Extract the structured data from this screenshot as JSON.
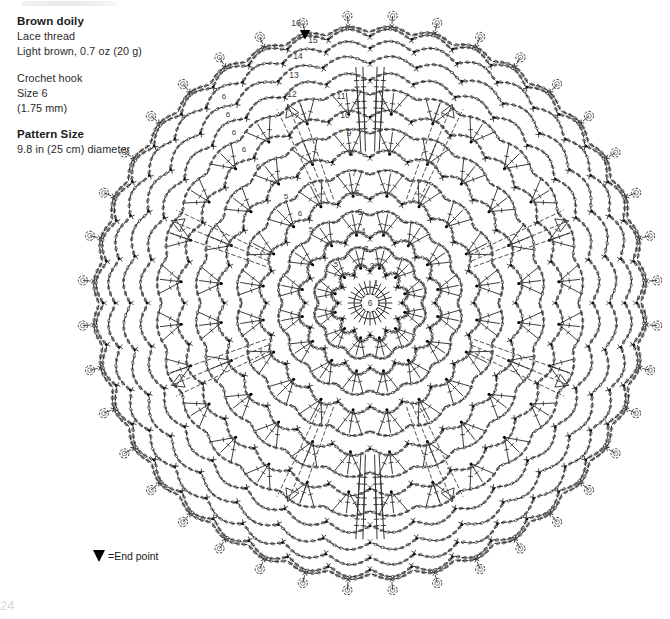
{
  "document": {
    "page_number": "24",
    "artifact_note": ""
  },
  "info": {
    "title": "Brown doily",
    "material_line1": "Lace thread",
    "material_line2": "Light brown, 0.7 oz (20 g)",
    "hook_line1": "Crochet hook",
    "hook_line2": "Size 6",
    "hook_line3": "(1.75 mm)",
    "size_heading": "Pattern Size",
    "size_value": "9.8 in (25 cm) diameter"
  },
  "legend": {
    "symbol": "end-point-triangle",
    "label": "=End point"
  },
  "chart_data": {
    "type": "diagram",
    "grid": false,
    "legend_position": "bottom-left",
    "center": {
      "x": 370,
      "y": 303
    },
    "outer_radius": 288,
    "symmetry_sectors": 8,
    "ink_color": "#333333",
    "accent_color": "#000000",
    "label_color": "#3a3a3a",
    "center_ring": {
      "label": "6",
      "radius": 9
    },
    "end_point": {
      "x": 305,
      "y": 30,
      "round": 16
    },
    "round_labels": [
      {
        "round": 1,
        "text": "1",
        "x": 376,
        "y": 286
      },
      {
        "round": 2,
        "text": "2",
        "x": 372,
        "y": 269
      },
      {
        "round": 3,
        "text": "3",
        "x": 366,
        "y": 252
      },
      {
        "round": 4,
        "text": "4",
        "x": 363,
        "y": 234
      },
      {
        "round": 5,
        "text": "5",
        "x": 360,
        "y": 215
      },
      {
        "round": 6,
        "text": "6",
        "x": 357,
        "y": 196
      },
      {
        "round": 7,
        "text": "7",
        "x": 354,
        "y": 176
      },
      {
        "round": 8,
        "text": "8",
        "x": 351,
        "y": 156
      },
      {
        "round": 9,
        "text": "9",
        "x": 349,
        "y": 136
      },
      {
        "round": 10,
        "text": "10",
        "x": 345,
        "y": 118
      },
      {
        "round": 11,
        "text": "11",
        "x": 341,
        "y": 99
      },
      {
        "round": 12,
        "text": "12",
        "x": 292,
        "y": 97
      },
      {
        "round": 13,
        "text": "13",
        "x": 294,
        "y": 78
      },
      {
        "round": 14,
        "text": "14",
        "x": 298,
        "y": 59
      },
      {
        "round": 15,
        "text": "15",
        "x": 313,
        "y": 43
      },
      {
        "round": 16,
        "text": "16",
        "x": 296,
        "y": 26
      }
    ],
    "inner_round_labels": [
      {
        "text": "6",
        "x": 341,
        "y": 289
      },
      {
        "text": "5",
        "x": 336,
        "y": 267
      },
      {
        "text": "4",
        "x": 327,
        "y": 247
      },
      {
        "text": "5",
        "x": 311,
        "y": 232
      },
      {
        "text": "6",
        "x": 300,
        "y": 216
      },
      {
        "text": "5",
        "x": 286,
        "y": 199
      },
      {
        "text": "6",
        "x": 272,
        "y": 185
      },
      {
        "text": "6",
        "x": 258,
        "y": 169
      },
      {
        "text": "6",
        "x": 244,
        "y": 152
      },
      {
        "text": "6",
        "x": 234,
        "y": 135
      },
      {
        "text": "6",
        "x": 228,
        "y": 117
      },
      {
        "text": "6",
        "x": 224,
        "y": 99
      }
    ],
    "rounds": [
      {
        "n": 1,
        "radius": 22,
        "type": "spoke-ring",
        "repeats": 24,
        "note": "double crochet into center ring"
      },
      {
        "n": 2,
        "radius": 38,
        "type": "arc-chain",
        "repeats": 12,
        "note": "chain arcs"
      },
      {
        "n": 3,
        "radius": 54,
        "type": "fan-cluster",
        "repeats": 12,
        "note": "shell fans"
      },
      {
        "n": 4,
        "radius": 71,
        "type": "arc-chain",
        "repeats": 16,
        "note": "chain-4 loops"
      },
      {
        "n": 5,
        "radius": 90,
        "type": "fan-cluster",
        "repeats": 16,
        "note": "chain-5 loops"
      },
      {
        "n": 6,
        "radius": 110,
        "type": "arc-chain",
        "repeats": 20,
        "note": "chain-6 loops"
      },
      {
        "n": 7,
        "radius": 131,
        "type": "fan-cluster",
        "repeats": 20,
        "note": "shell fans"
      },
      {
        "n": 8,
        "radius": 152,
        "type": "arc-chain",
        "repeats": 24,
        "note": "chain arcs"
      },
      {
        "n": 9,
        "radius": 172,
        "type": "fan-cluster",
        "repeats": 24,
        "note": "shell fans"
      },
      {
        "n": 10,
        "radius": 192,
        "type": "arc-chain",
        "repeats": 28,
        "note": "chain arcs"
      },
      {
        "n": 11,
        "radius": 211,
        "type": "fan-cluster",
        "repeats": 28,
        "note": "shell fans"
      },
      {
        "n": 12,
        "radius": 229,
        "type": "arc-chain",
        "repeats": 32,
        "note": "chain arcs"
      },
      {
        "n": 13,
        "radius": 246,
        "type": "arc-chain",
        "repeats": 32,
        "note": "chain arcs"
      },
      {
        "n": 14,
        "radius": 261,
        "type": "arc-chain",
        "repeats": 36,
        "note": "chain arcs"
      },
      {
        "n": 15,
        "radius": 273,
        "type": "arc-chain",
        "repeats": 40,
        "note": "chain arcs"
      },
      {
        "n": 16,
        "radius": 288,
        "type": "picot-ring",
        "repeats": 40,
        "note": "picot edge rings"
      }
    ],
    "motifs": {
      "v_clusters": {
        "count": 4,
        "angles_deg": [
          90,
          270,
          90,
          270
        ],
        "note": "vertical dc groups top and bottom"
      },
      "arrow_spokes": {
        "count": 8,
        "note": "diagonal join arrows at 45 degree sectors"
      }
    }
  }
}
